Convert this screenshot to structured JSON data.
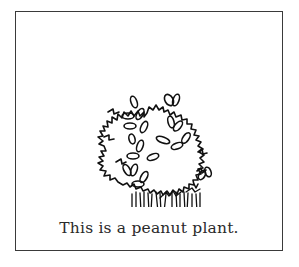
{
  "figure": {
    "illustration": {
      "subject": "peanut-plant",
      "icon": "peanut-plant-line-drawing"
    },
    "caption": "This is a peanut plant.",
    "colors": {
      "border": "#3a3a3a",
      "ink": "#111111",
      "background": "#ffffff"
    }
  }
}
